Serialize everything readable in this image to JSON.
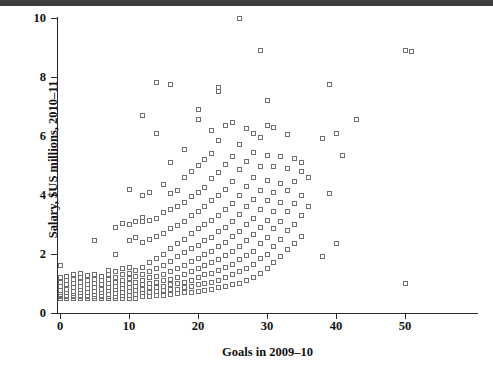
{
  "figure": {
    "background_color": "#ffffff",
    "marker_color": "#6f6f6f",
    "axis_color": "#2a2a2a",
    "top_band_color": "#3d3d3d"
  },
  "chart_data": {
    "type": "scatter",
    "title": "",
    "xlabel": "Goals in 2009–10",
    "ylabel": "Salary, $US millions, 2010–11",
    "xlim": [
      -1.0,
      54.5
    ],
    "ylim": [
      0.0,
      10.05
    ],
    "grid": false,
    "legend": null,
    "xticks": [
      0,
      10,
      20,
      30,
      40,
      50
    ],
    "xticklabels": [
      "0",
      "10",
      "20",
      "30",
      "40",
      "50"
    ],
    "yticks": [
      0,
      2,
      4,
      6,
      8,
      10
    ],
    "yticklabels": [
      "0",
      "2",
      "4",
      "6",
      "8",
      "10"
    ],
    "marker": "open-square",
    "n_points": 288,
    "points": [
      [
        0,
        0.5
      ],
      [
        0,
        0.55
      ],
      [
        0,
        0.6
      ],
      [
        0,
        0.62
      ],
      [
        0,
        0.68
      ],
      [
        0,
        0.75
      ],
      [
        0,
        0.9
      ],
      [
        0,
        1.05
      ],
      [
        0,
        1.2
      ],
      [
        0,
        1.6
      ],
      [
        1,
        0.5
      ],
      [
        1,
        0.55
      ],
      [
        1,
        0.6
      ],
      [
        1,
        0.7
      ],
      [
        1,
        0.8
      ],
      [
        1,
        0.95
      ],
      [
        1,
        1.1
      ],
      [
        1,
        1.25
      ],
      [
        2,
        0.5
      ],
      [
        2,
        0.55
      ],
      [
        2,
        0.6
      ],
      [
        2,
        0.65
      ],
      [
        2,
        0.72
      ],
      [
        2,
        0.85
      ],
      [
        2,
        1.0
      ],
      [
        2,
        1.15
      ],
      [
        2,
        1.3
      ],
      [
        3,
        0.5
      ],
      [
        3,
        0.55
      ],
      [
        3,
        0.6
      ],
      [
        3,
        0.68
      ],
      [
        3,
        0.78
      ],
      [
        3,
        0.9
      ],
      [
        3,
        1.05
      ],
      [
        3,
        1.2
      ],
      [
        3,
        1.35
      ],
      [
        4,
        0.5
      ],
      [
        4,
        0.55
      ],
      [
        4,
        0.6
      ],
      [
        4,
        0.7
      ],
      [
        4,
        0.82
      ],
      [
        4,
        0.95
      ],
      [
        4,
        1.1
      ],
      [
        4,
        1.28
      ],
      [
        5,
        0.5
      ],
      [
        5,
        0.55
      ],
      [
        5,
        0.62
      ],
      [
        5,
        0.72
      ],
      [
        5,
        0.85
      ],
      [
        5,
        1.0
      ],
      [
        5,
        1.15
      ],
      [
        5,
        1.3
      ],
      [
        5,
        2.45
      ],
      [
        6,
        0.5
      ],
      [
        6,
        0.55
      ],
      [
        6,
        0.6
      ],
      [
        6,
        0.7
      ],
      [
        6,
        0.8
      ],
      [
        6,
        0.95
      ],
      [
        6,
        1.1
      ],
      [
        6,
        1.25
      ],
      [
        7,
        0.5
      ],
      [
        7,
        0.55
      ],
      [
        7,
        0.62
      ],
      [
        7,
        0.75
      ],
      [
        7,
        0.88
      ],
      [
        7,
        1.0
      ],
      [
        7,
        1.15
      ],
      [
        7,
        1.3
      ],
      [
        7,
        1.45
      ],
      [
        8,
        0.5
      ],
      [
        8,
        0.55
      ],
      [
        8,
        0.65
      ],
      [
        8,
        0.78
      ],
      [
        8,
        0.9
      ],
      [
        8,
        1.05
      ],
      [
        8,
        1.2
      ],
      [
        8,
        1.4
      ],
      [
        8,
        2.0
      ],
      [
        8,
        2.9
      ],
      [
        9,
        0.5
      ],
      [
        9,
        0.58
      ],
      [
        9,
        0.7
      ],
      [
        9,
        0.82
      ],
      [
        9,
        0.95
      ],
      [
        9,
        1.1
      ],
      [
        9,
        1.3
      ],
      [
        9,
        1.5
      ],
      [
        9,
        3.05
      ],
      [
        10,
        0.5
      ],
      [
        10,
        0.6
      ],
      [
        10,
        0.72
      ],
      [
        10,
        0.85
      ],
      [
        10,
        1.0
      ],
      [
        10,
        1.18
      ],
      [
        10,
        1.35
      ],
      [
        10,
        1.55
      ],
      [
        10,
        2.45
      ],
      [
        10,
        3.0
      ],
      [
        10,
        4.2
      ],
      [
        11,
        0.5
      ],
      [
        11,
        0.62
      ],
      [
        11,
        0.75
      ],
      [
        11,
        0.9
      ],
      [
        11,
        1.05
      ],
      [
        11,
        1.25
      ],
      [
        11,
        1.45
      ],
      [
        11,
        2.55
      ],
      [
        11,
        3.1
      ],
      [
        12,
        0.55
      ],
      [
        12,
        0.68
      ],
      [
        12,
        0.8
      ],
      [
        12,
        0.95
      ],
      [
        12,
        1.1
      ],
      [
        12,
        1.3
      ],
      [
        12,
        1.55
      ],
      [
        12,
        2.4
      ],
      [
        12,
        3.1
      ],
      [
        12,
        3.25
      ],
      [
        12,
        4.0
      ],
      [
        12,
        6.7
      ],
      [
        13,
        0.55
      ],
      [
        13,
        0.7
      ],
      [
        13,
        0.85
      ],
      [
        13,
        1.0
      ],
      [
        13,
        1.2
      ],
      [
        13,
        1.4
      ],
      [
        13,
        1.7
      ],
      [
        13,
        2.5
      ],
      [
        13,
        3.15
      ],
      [
        13,
        4.1
      ],
      [
        14,
        0.58
      ],
      [
        14,
        0.72
      ],
      [
        14,
        0.88
      ],
      [
        14,
        1.05
      ],
      [
        14,
        1.25
      ],
      [
        14,
        1.5
      ],
      [
        14,
        1.85
      ],
      [
        14,
        2.6
      ],
      [
        14,
        3.2
      ],
      [
        14,
        6.1
      ],
      [
        14,
        7.8
      ],
      [
        15,
        0.6
      ],
      [
        15,
        0.75
      ],
      [
        15,
        0.9
      ],
      [
        15,
        1.1
      ],
      [
        15,
        1.3
      ],
      [
        15,
        1.6
      ],
      [
        15,
        2.0
      ],
      [
        15,
        2.7
      ],
      [
        15,
        3.4
      ],
      [
        15,
        4.35
      ],
      [
        16,
        0.62
      ],
      [
        16,
        0.78
      ],
      [
        16,
        0.95
      ],
      [
        16,
        1.15
      ],
      [
        16,
        1.4
      ],
      [
        16,
        1.75
      ],
      [
        16,
        2.2
      ],
      [
        16,
        2.85
      ],
      [
        16,
        3.5
      ],
      [
        16,
        4.05
      ],
      [
        16,
        5.1
      ],
      [
        16,
        7.75
      ],
      [
        17,
        0.65
      ],
      [
        17,
        0.8
      ],
      [
        17,
        1.0
      ],
      [
        17,
        1.2
      ],
      [
        17,
        1.5
      ],
      [
        17,
        1.9
      ],
      [
        17,
        2.35
      ],
      [
        17,
        2.95
      ],
      [
        17,
        3.6
      ],
      [
        17,
        4.15
      ],
      [
        18,
        0.68
      ],
      [
        18,
        0.85
      ],
      [
        18,
        1.05
      ],
      [
        18,
        1.3
      ],
      [
        18,
        1.6
      ],
      [
        18,
        2.05
      ],
      [
        18,
        2.5
      ],
      [
        18,
        3.1
      ],
      [
        18,
        3.75
      ],
      [
        18,
        4.6
      ],
      [
        18,
        5.55
      ],
      [
        19,
        0.7
      ],
      [
        19,
        0.9
      ],
      [
        19,
        1.1
      ],
      [
        19,
        1.4
      ],
      [
        19,
        1.75
      ],
      [
        19,
        2.2
      ],
      [
        19,
        2.7
      ],
      [
        19,
        3.3
      ],
      [
        19,
        3.95
      ],
      [
        19,
        4.8
      ],
      [
        20,
        0.72
      ],
      [
        20,
        0.95
      ],
      [
        20,
        1.2
      ],
      [
        20,
        1.5
      ],
      [
        20,
        1.85
      ],
      [
        20,
        2.3
      ],
      [
        20,
        2.85
      ],
      [
        20,
        3.45
      ],
      [
        20,
        4.1
      ],
      [
        20,
        5.0
      ],
      [
        20,
        6.55
      ],
      [
        20,
        6.9
      ],
      [
        21,
        0.75
      ],
      [
        21,
        1.0
      ],
      [
        21,
        1.3
      ],
      [
        21,
        1.6
      ],
      [
        21,
        2.0
      ],
      [
        21,
        2.45
      ],
      [
        21,
        3.0
      ],
      [
        21,
        3.6
      ],
      [
        21,
        4.25
      ],
      [
        21,
        5.2
      ],
      [
        22,
        0.8
      ],
      [
        22,
        1.05
      ],
      [
        22,
        1.35
      ],
      [
        22,
        1.7
      ],
      [
        22,
        2.1
      ],
      [
        22,
        2.55
      ],
      [
        22,
        3.15
      ],
      [
        22,
        3.8
      ],
      [
        22,
        4.55
      ],
      [
        22,
        5.4
      ],
      [
        22,
        6.2
      ],
      [
        23,
        0.85
      ],
      [
        23,
        1.1
      ],
      [
        23,
        1.45
      ],
      [
        23,
        1.8
      ],
      [
        23,
        2.25
      ],
      [
        23,
        2.75
      ],
      [
        23,
        3.3
      ],
      [
        23,
        4.0
      ],
      [
        23,
        4.75
      ],
      [
        23,
        5.85
      ],
      [
        23,
        7.5
      ],
      [
        23,
        7.65
      ],
      [
        24,
        0.9
      ],
      [
        24,
        1.2
      ],
      [
        24,
        1.55
      ],
      [
        24,
        1.95
      ],
      [
        24,
        2.4
      ],
      [
        24,
        2.9
      ],
      [
        24,
        3.5
      ],
      [
        24,
        4.2
      ],
      [
        24,
        5.05
      ],
      [
        24,
        6.35
      ],
      [
        25,
        0.95
      ],
      [
        25,
        1.3
      ],
      [
        25,
        1.65
      ],
      [
        25,
        2.1
      ],
      [
        25,
        2.6
      ],
      [
        25,
        3.1
      ],
      [
        25,
        3.7
      ],
      [
        25,
        4.45
      ],
      [
        25,
        5.3
      ],
      [
        25,
        6.45
      ],
      [
        26,
        1.0
      ],
      [
        26,
        1.4
      ],
      [
        26,
        1.8
      ],
      [
        26,
        2.25
      ],
      [
        26,
        2.75
      ],
      [
        26,
        3.35
      ],
      [
        26,
        4.0
      ],
      [
        26,
        4.85
      ],
      [
        26,
        5.7
      ],
      [
        26,
        10.0
      ],
      [
        27,
        1.1
      ],
      [
        27,
        1.5
      ],
      [
        27,
        1.95
      ],
      [
        27,
        2.45
      ],
      [
        27,
        3.0
      ],
      [
        27,
        3.6
      ],
      [
        27,
        4.3
      ],
      [
        27,
        5.15
      ],
      [
        27,
        6.25
      ],
      [
        28,
        1.2
      ],
      [
        28,
        1.65
      ],
      [
        28,
        2.1
      ],
      [
        28,
        2.65
      ],
      [
        28,
        3.2
      ],
      [
        28,
        3.85
      ],
      [
        28,
        4.6
      ],
      [
        28,
        5.45
      ],
      [
        28,
        6.1
      ],
      [
        29,
        1.35
      ],
      [
        29,
        1.85
      ],
      [
        29,
        2.35
      ],
      [
        29,
        2.9
      ],
      [
        29,
        3.5
      ],
      [
        29,
        4.15
      ],
      [
        29,
        4.95
      ],
      [
        29,
        5.95
      ],
      [
        29,
        8.9
      ],
      [
        30,
        1.5
      ],
      [
        30,
        2.0
      ],
      [
        30,
        2.55
      ],
      [
        30,
        3.15
      ],
      [
        30,
        3.8
      ],
      [
        30,
        4.5
      ],
      [
        30,
        5.35
      ],
      [
        30,
        6.35
      ],
      [
        30,
        7.2
      ],
      [
        31,
        1.7
      ],
      [
        31,
        2.25
      ],
      [
        31,
        2.85
      ],
      [
        31,
        3.45
      ],
      [
        31,
        4.1
      ],
      [
        31,
        4.95
      ],
      [
        31,
        6.3
      ],
      [
        32,
        1.9
      ],
      [
        32,
        2.5
      ],
      [
        32,
        3.1
      ],
      [
        32,
        3.75
      ],
      [
        32,
        4.4
      ],
      [
        32,
        5.3
      ],
      [
        33,
        2.15
      ],
      [
        33,
        2.8
      ],
      [
        33,
        3.45
      ],
      [
        33,
        4.15
      ],
      [
        33,
        4.9
      ],
      [
        33,
        6.05
      ],
      [
        34,
        2.35
      ],
      [
        34,
        3.0
      ],
      [
        34,
        3.7
      ],
      [
        34,
        4.45
      ],
      [
        34,
        5.25
      ],
      [
        35,
        2.6
      ],
      [
        35,
        3.3
      ],
      [
        35,
        4.0
      ],
      [
        35,
        4.8
      ],
      [
        35,
        5.1
      ],
      [
        36,
        3.6
      ],
      [
        36,
        4.6
      ],
      [
        38,
        1.9
      ],
      [
        38,
        5.9
      ],
      [
        39,
        4.05
      ],
      [
        39,
        7.75
      ],
      [
        40,
        2.35
      ],
      [
        40,
        6.1
      ],
      [
        41,
        5.35
      ],
      [
        43,
        6.55
      ],
      [
        50,
        8.9
      ],
      [
        50,
        1.0
      ],
      [
        51,
        8.85
      ]
    ]
  }
}
